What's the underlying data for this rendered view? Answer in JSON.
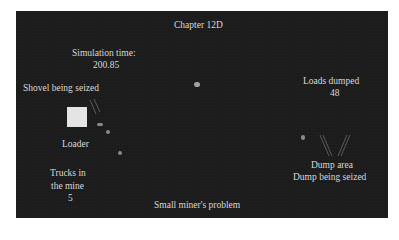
{
  "title": "Chapter 12D",
  "simulation": {
    "time_label": "Simulation time:",
    "time_value": "200.85"
  },
  "loader": {
    "status": "Shovel being seized",
    "label": "Loader"
  },
  "loads": {
    "label": "Loads dumped",
    "value": "48"
  },
  "dump": {
    "label": "Dump area",
    "status": "Dump being seized"
  },
  "trucks": {
    "label_line1": "Trucks in",
    "label_line2": "the mine",
    "value": "5"
  },
  "footer": "Small miner's problem",
  "colors": {
    "panel": "#1c1c1c",
    "text": "#d8d8d8",
    "loader": "#e4e4e4",
    "truck": "#8a8a8a"
  }
}
